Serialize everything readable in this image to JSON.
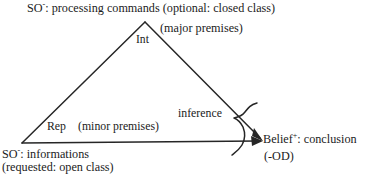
{
  "figure": {
    "background_color": "#ffffff",
    "line_color": "#262626"
  },
  "diagram_data": {
    "type": "diagram",
    "shape": "triangle",
    "vertices": [
      {
        "name": "apex",
        "label": "Int",
        "x": 145,
        "y": 22
      },
      {
        "name": "bottom-left",
        "label": "Rep",
        "x": 22,
        "y": 143
      },
      {
        "name": "bottom-right",
        "label": "Belief",
        "x": 263,
        "y": 141
      }
    ],
    "edges": [
      {
        "from": "bottom-left",
        "to": "apex",
        "arrow": false
      },
      {
        "from": "apex",
        "to": "bottom-right",
        "arrow": true
      },
      {
        "from": "bottom-left",
        "to": "bottom-right",
        "arrow": true
      }
    ],
    "brace": {
      "name": "inference-brace",
      "orientation": "rotated-left",
      "annotates": "inference"
    }
  },
  "labels": {
    "so_minus_top": {
      "prefix": "SO",
      "superscript": "-",
      "text": ": processing commands (optional: closed class)"
    },
    "major_premises": "(major premises)",
    "apex": "Int",
    "rep": "Rep",
    "minor_premises": "(minor premises)",
    "inference": "inference",
    "belief": {
      "prefix": "Belief",
      "superscript": "+",
      "text": ": conclusion"
    },
    "od": "(-OD)",
    "so_minus_bottom": {
      "prefix": "SO",
      "superscript": "-",
      "text": ": informations"
    },
    "requested": "(requested: open class)"
  }
}
